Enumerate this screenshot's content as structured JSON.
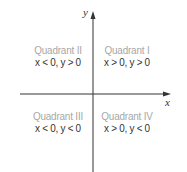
{
  "diagram": {
    "type": "coordinate-plane",
    "axes": {
      "x_label": "x",
      "y_label": "y",
      "color": "#333333"
    },
    "quadrants": [
      {
        "id": "I",
        "title": "Quadrant I",
        "condition": "x > 0, y > 0"
      },
      {
        "id": "II",
        "title": "Quadrant II",
        "condition": "x < 0, y > 0"
      },
      {
        "id": "III",
        "title": "Quadrant III",
        "condition": "x < 0, y < 0"
      },
      {
        "id": "IV",
        "title": "Quadrant IV",
        "condition": "x > 0, y < 0"
      }
    ],
    "colors": {
      "title": "#a7a7a7",
      "condition": "#333333",
      "background": "#ffffff"
    }
  }
}
